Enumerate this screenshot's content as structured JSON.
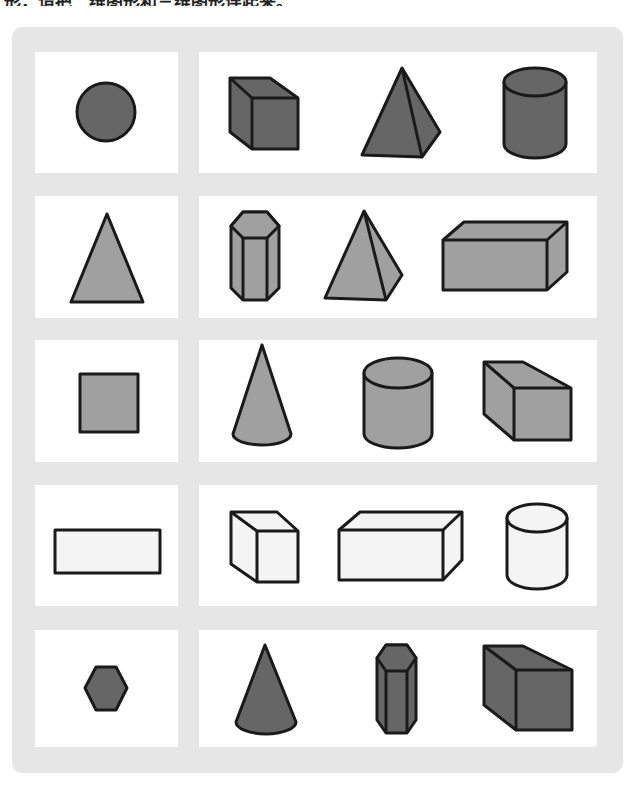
{
  "header": {
    "instruction_text": "形，请把二维图形和三维图形连起来。"
  },
  "colors": {
    "outer_background": "#e6e6e6",
    "panel_background": "#ffffff",
    "stroke": "#1a1a1a",
    "dark_fill": "#666666",
    "medium_fill": "#a0a0a0",
    "light_fill": "#f4f4f4"
  },
  "rows": [
    {
      "plane_shape": "circle",
      "fill": "dark",
      "solids": [
        "cube",
        "square-pyramid",
        "cylinder"
      ]
    },
    {
      "plane_shape": "triangle",
      "fill": "medium",
      "solids": [
        "hexagonal-prism",
        "square-pyramid",
        "rectangular-prism"
      ]
    },
    {
      "plane_shape": "square",
      "fill": "medium",
      "solids": [
        "cone",
        "cylinder",
        "cube"
      ]
    },
    {
      "plane_shape": "rectangle",
      "fill": "light",
      "solids": [
        "cube",
        "rectangular-prism",
        "cylinder"
      ]
    },
    {
      "plane_shape": "hexagon",
      "fill": "dark",
      "solids": [
        "cone",
        "hexagonal-prism",
        "cube"
      ]
    }
  ]
}
